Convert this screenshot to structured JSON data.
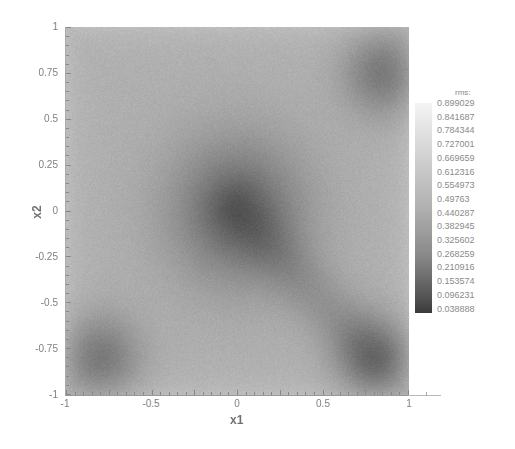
{
  "chart_data": {
    "type": "heatmap",
    "title": "",
    "xlabel": "x1",
    "ylabel": "x2",
    "xlim": [
      -1,
      1
    ],
    "ylim": [
      -1,
      1
    ],
    "x_ticks": [
      "-1",
      "-0.5",
      "0",
      "0.5",
      "1"
    ],
    "y_ticks": [
      "1",
      "0.75",
      "0.5",
      "0.25",
      "0",
      "-0.25",
      "-0.5",
      "-0.75",
      "-1"
    ],
    "colorbar": {
      "title": "rms:",
      "levels": [
        "0.899029",
        "0.841687",
        "0.784344",
        "0.727001",
        "0.669659",
        "0.612316",
        "0.554973",
        "0.49763",
        "0.440287",
        "0.382945",
        "0.325602",
        "0.268259",
        "0.210916",
        "0.153574",
        "0.096231",
        "0.038888"
      ],
      "colormap": "grayscale (light=high, dark=low)"
    },
    "features": [
      {
        "type": "minimum",
        "x": 0.0,
        "y": 0.0,
        "approx_value": 0.27
      },
      {
        "type": "minimum",
        "x": 0.85,
        "y": 0.75,
        "approx_value": 0.33
      },
      {
        "type": "minimum",
        "x": -0.8,
        "y": -0.8,
        "approx_value": 0.33
      },
      {
        "type": "minimum",
        "x": 0.8,
        "y": -0.8,
        "approx_value": 0.35
      },
      {
        "type": "dark_band",
        "from": [
          0.0,
          0.0
        ],
        "to": [
          0.8,
          -0.8
        ]
      },
      {
        "type": "light_region",
        "description": "edges and off-diagonal regions",
        "approx_value": 0.55
      }
    ],
    "grid": false,
    "legend_position": "right"
  },
  "axes": {
    "x_title": "x1",
    "y_title": "x2"
  }
}
